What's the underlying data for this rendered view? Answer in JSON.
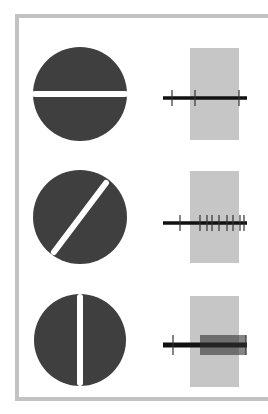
{
  "figure": {
    "colors": {
      "frame": "#c2c2c2",
      "disc": "#3f3f3f",
      "bar": "#ffffff",
      "stimulus_window": "#c6c6c6",
      "trace": "#111111"
    },
    "panels": [
      {
        "id": "horizontal",
        "orientation_deg": 0,
        "circle": {
          "cx": 80,
          "cy": 94,
          "r": 47
        },
        "bar": {
          "x1": 35,
          "y1": 94,
          "x2": 125,
          "y2": 94
        },
        "window": {
          "x": 190,
          "y": 48,
          "w": 49,
          "h": 92
        },
        "trace": {
          "y": 98,
          "x1": 163,
          "x2": 247
        },
        "spikes": [
          172,
          195,
          239
        ],
        "spike_half_height": 8,
        "response": "weak"
      },
      {
        "id": "oblique",
        "orientation_deg": 45,
        "circle": {
          "cx": 80,
          "cy": 217,
          "r": 47
        },
        "bar": {
          "x1": 54,
          "y1": 252,
          "x2": 106,
          "y2": 183
        },
        "window": {
          "x": 190,
          "y": 171,
          "w": 49,
          "h": 92
        },
        "trace": {
          "y": 223,
          "x1": 163,
          "x2": 247
        },
        "spikes": [
          180,
          200,
          207,
          212,
          219,
          227,
          233,
          240,
          244
        ],
        "spike_half_height": 8,
        "response": "moderate"
      },
      {
        "id": "vertical",
        "orientation_deg": 90,
        "circle": {
          "cx": 80,
          "cy": 340,
          "r": 46
        },
        "bar": {
          "x1": 80,
          "y1": 297,
          "x2": 80,
          "y2": 383
        },
        "window": {
          "x": 190,
          "y": 296,
          "w": 49,
          "h": 91
        },
        "trace": {
          "y": 345,
          "x1": 163,
          "x2": 247
        },
        "spikes": [
          173,
          201,
          203,
          205,
          207,
          209,
          211,
          213,
          215,
          217,
          219,
          221,
          223,
          225,
          227,
          229,
          231,
          233,
          235,
          237,
          239,
          241,
          243,
          245,
          246
        ],
        "spike_half_height": 10,
        "response": "strong"
      }
    ]
  }
}
